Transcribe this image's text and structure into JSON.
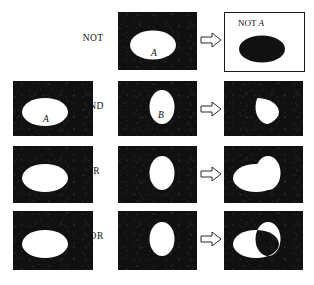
{
  "figure": {
    "background_color": "#ffffff",
    "panel_fill": "#101010",
    "shape_fill": "#ffffff",
    "outline_color": "#1a1a1a"
  },
  "rows": [
    {
      "id": "not",
      "operation_label": "NOT",
      "left_panel": null,
      "middle_panel": {
        "set_label": "A",
        "shape": "ellipse-horizontal"
      },
      "arrow": "right-arrow",
      "result_panel": {
        "style": "inverted",
        "caption_prefix": "NOT",
        "caption_set": "A",
        "shape": "ellipse-horizontal-black"
      }
    },
    {
      "id": "and",
      "operation_label": "AND",
      "left_panel": {
        "set_label": "A",
        "shape": "ellipse-horizontal"
      },
      "middle_panel": {
        "set_label": "B",
        "shape": "ellipse-vertical"
      },
      "arrow": "right-arrow",
      "result_panel": {
        "style": "normal",
        "shape": "intersection-lens"
      }
    },
    {
      "id": "or",
      "operation_label": "OR",
      "left_panel": {
        "set_label": "",
        "shape": "ellipse-horizontal"
      },
      "middle_panel": {
        "set_label": "",
        "shape": "ellipse-vertical"
      },
      "arrow": "right-arrow",
      "result_panel": {
        "style": "normal",
        "shape": "union"
      }
    },
    {
      "id": "xor",
      "operation_label": "XOR",
      "left_panel": {
        "set_label": "",
        "shape": "ellipse-horizontal"
      },
      "middle_panel": {
        "set_label": "",
        "shape": "ellipse-vertical"
      },
      "arrow": "right-arrow",
      "result_panel": {
        "style": "normal",
        "shape": "symmetric-difference"
      }
    }
  ],
  "labels": {
    "not": "NOT",
    "and": "AND",
    "or": "OR",
    "xor": "XOR",
    "set_a": "A",
    "set_b": "B",
    "not_a_prefix": "NOT",
    "not_a_set": "A"
  }
}
